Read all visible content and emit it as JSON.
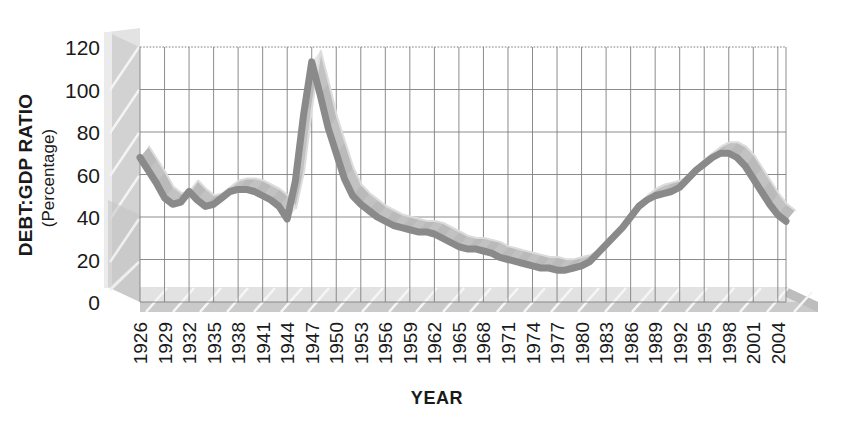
{
  "chart_data": {
    "type": "line",
    "title": "",
    "xlabel": "YEAR",
    "ylabel": "DEBT:GDP RATIO",
    "ylabel_sub": "(Percentage)",
    "ylim": [
      0,
      120
    ],
    "xlim": [
      1926,
      2005
    ],
    "yticks": [
      0,
      20,
      40,
      60,
      80,
      100,
      120
    ],
    "xticks": [
      1926,
      1929,
      1932,
      1935,
      1938,
      1941,
      1944,
      1947,
      1950,
      1953,
      1956,
      1959,
      1962,
      1965,
      1968,
      1971,
      1974,
      1977,
      1980,
      1983,
      1986,
      1989,
      1992,
      1995,
      1998,
      2001,
      2004
    ],
    "grid": true,
    "legend": false,
    "style": "3d-ribbon",
    "series": [
      {
        "name": "Debt to GDP ratio",
        "x": [
          1926,
          1927,
          1928,
          1929,
          1930,
          1931,
          1932,
          1933,
          1934,
          1935,
          1936,
          1937,
          1938,
          1939,
          1940,
          1941,
          1942,
          1943,
          1944,
          1945,
          1946,
          1947,
          1948,
          1949,
          1950,
          1951,
          1952,
          1953,
          1954,
          1955,
          1956,
          1957,
          1958,
          1959,
          1960,
          1961,
          1962,
          1963,
          1964,
          1965,
          1966,
          1967,
          1968,
          1969,
          1970,
          1971,
          1972,
          1973,
          1974,
          1975,
          1976,
          1977,
          1978,
          1979,
          1980,
          1981,
          1982,
          1983,
          1984,
          1985,
          1986,
          1987,
          1988,
          1989,
          1990,
          1991,
          1992,
          1993,
          1994,
          1995,
          1996,
          1997,
          1998,
          1999,
          2000,
          2001,
          2002,
          2003,
          2004,
          2005
        ],
        "values": [
          68,
          62,
          56,
          49,
          46,
          47,
          52,
          48,
          45,
          46,
          49,
          52,
          53,
          53,
          52,
          50,
          48,
          45,
          39,
          57,
          88,
          113,
          98,
          82,
          70,
          58,
          50,
          46,
          43,
          40,
          38,
          36,
          35,
          34,
          33,
          33,
          32,
          30,
          28,
          26,
          25,
          25,
          24,
          23,
          21,
          20,
          19,
          18,
          17,
          16,
          16,
          15,
          15,
          16,
          17,
          19,
          23,
          27,
          31,
          35,
          40,
          45,
          48,
          50,
          51,
          52,
          54,
          58,
          62,
          65,
          68,
          70,
          70,
          68,
          64,
          58,
          52,
          46,
          41,
          38
        ]
      }
    ]
  },
  "axis_labels": {
    "y_title": "DEBT:GDP RATIO",
    "y_subtitle": "(Percentage)",
    "x_title": "YEAR"
  },
  "colors": {
    "line": "#8a8a8a",
    "ribbon": "#c2c2c2",
    "ribbon_dark": "#a8a8a8",
    "grid": "#7f7f7f",
    "floor": "#c9c9c9",
    "floor_light": "#e0e0e0",
    "wall": "#d6d6d6",
    "wall_light": "#e8e8e8",
    "text": "#1a1a1a",
    "background": "#ffffff"
  }
}
